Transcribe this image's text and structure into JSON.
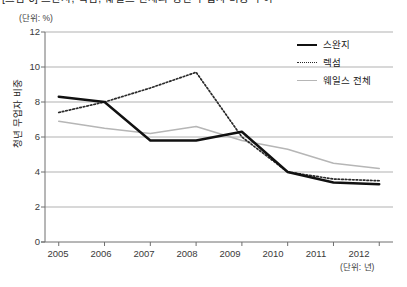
{
  "caption": "[그림 3] 스완지, 렉섬, 웨일스 전체의 청년 무업자 비중 추이",
  "axes": {
    "unit_y_label": "(단위: %)",
    "unit_x_label": "(단위: 년)",
    "y_axis_title": "청년 무업자 비중",
    "y_ticks": [
      "0",
      "2",
      "4",
      "6",
      "8",
      "10",
      "12"
    ],
    "x_ticks": [
      "2005",
      "2006",
      "2007",
      "2008",
      "2009",
      "2010",
      "2011",
      "2012"
    ]
  },
  "legend": {
    "position": "top-right",
    "items": [
      {
        "label": "스완지",
        "style": "solid-thick",
        "color": "#111111"
      },
      {
        "label": "렉섬",
        "style": "dotted",
        "color": "#2a2a2a"
      },
      {
        "label": "웨일스 전체",
        "style": "solid-light",
        "color": "#b6b6b6"
      }
    ]
  },
  "colors": {
    "swansea": "#111111",
    "wrexham": "#2a2a2a",
    "wales": "#b6b6b6",
    "grid": "#a8a8a8",
    "axis": "#6e6e6e",
    "background": "#ffffff"
  },
  "chart_data": {
    "type": "line",
    "title": "[그림 3] 스완지, 렉섬, 웨일스 전체의 청년 무업자 비중 추이",
    "xlabel": "(단위: 년)",
    "ylabel": "청년 무업자 비중",
    "x": [
      2005,
      2006,
      2007,
      2008,
      2009,
      2010,
      2011,
      2012
    ],
    "ylim": [
      0,
      12
    ],
    "yticks": [
      0,
      2,
      4,
      6,
      8,
      10,
      12
    ],
    "grid": true,
    "legend_position": "top-right",
    "series": [
      {
        "name": "스완지",
        "style": "solid-thick",
        "color": "#111111",
        "values": [
          8.3,
          8.0,
          5.8,
          5.8,
          6.3,
          4.0,
          3.4,
          3.3
        ]
      },
      {
        "name": "렉섬",
        "style": "dotted",
        "color": "#2a2a2a",
        "values": [
          7.4,
          8.0,
          8.8,
          9.7,
          6.0,
          4.0,
          3.6,
          3.5
        ]
      },
      {
        "name": "웨일스 전체",
        "style": "solid-light",
        "color": "#b6b6b6",
        "values": [
          6.9,
          6.5,
          6.2,
          6.6,
          5.8,
          5.3,
          4.5,
          4.2
        ]
      }
    ]
  }
}
